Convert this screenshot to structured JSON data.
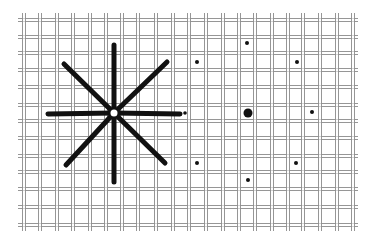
{
  "diagram": {
    "background": "#ffffff",
    "grid": {
      "line_color": "#8a8a8a",
      "gap_color": "#ffffff",
      "extent": {
        "x0": 18,
        "x1": 358,
        "y0": 13,
        "y1": 231
      },
      "vertical_x": [
        24,
        40,
        57,
        73,
        90,
        106,
        122,
        138,
        156,
        173,
        189,
        206,
        223,
        239,
        255,
        272,
        288,
        303,
        320,
        337,
        353
      ],
      "horizontal_y": [
        20,
        37,
        53,
        70,
        87,
        105,
        121,
        138,
        156,
        172,
        189,
        207,
        225
      ]
    },
    "star": {
      "center": [
        114,
        113
      ],
      "color": "#111111",
      "stroke_width": 5,
      "center_hole_radius": 3.5,
      "rays": [
        {
          "name": "up",
          "end": [
            114,
            45
          ]
        },
        {
          "name": "down",
          "end": [
            114,
            182
          ]
        },
        {
          "name": "left",
          "end": [
            48,
            114
          ]
        },
        {
          "name": "right",
          "end": [
            180,
            114
          ]
        },
        {
          "name": "up-left",
          "end": [
            64,
            64
          ]
        },
        {
          "name": "up-right",
          "end": [
            167,
            62
          ]
        },
        {
          "name": "down-left",
          "end": [
            66,
            165
          ]
        },
        {
          "name": "down-right",
          "end": [
            165,
            163
          ]
        }
      ]
    },
    "dot_pattern": {
      "color": "#111111",
      "center_dot": {
        "x": 248,
        "y": 113,
        "r": 4.5
      },
      "dots": [
        {
          "name": "top",
          "x": 247,
          "y": 43,
          "r": 2
        },
        {
          "name": "top-left",
          "x": 197,
          "y": 62,
          "r": 2
        },
        {
          "name": "top-right",
          "x": 297,
          "y": 62,
          "r": 2
        },
        {
          "name": "left",
          "x": 185,
          "y": 113,
          "r": 1.8
        },
        {
          "name": "right",
          "x": 312,
          "y": 112,
          "r": 2
        },
        {
          "name": "bottom-left",
          "x": 197,
          "y": 163,
          "r": 2
        },
        {
          "name": "bottom-right",
          "x": 296,
          "y": 163,
          "r": 2
        },
        {
          "name": "bottom",
          "x": 248,
          "y": 180,
          "r": 2
        }
      ]
    }
  }
}
